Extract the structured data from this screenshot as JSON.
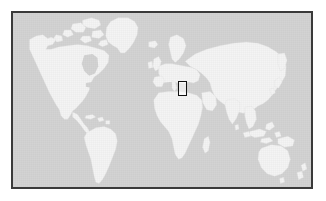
{
  "figure": {
    "kind": "locator-map",
    "title": "World locator map",
    "caption": "",
    "width_px": 326,
    "height_px": 201
  },
  "map": {
    "projection": "equirectangular",
    "lon_range": [
      -180,
      180
    ],
    "lat_range": [
      -60,
      84
    ],
    "colors": {
      "ocean": "#d2d2d2",
      "land": "#f3f3f3",
      "coastline": "#e3e3e3",
      "frame": "#3a3a3a",
      "highlight_stroke": "#111111",
      "page_background": "#ffffff"
    },
    "frame": {
      "left_px": 11,
      "top_px": 11,
      "width_px": 302,
      "height_px": 178,
      "border_px": 2
    },
    "legend": [],
    "labels": [],
    "graticule": false
  },
  "highlight": {
    "name": "highlight-rectangle",
    "description": "Small rectangle outlining a region of south-central Europe / the Balkans",
    "lon_range": [
      14,
      25
    ],
    "lat_range": [
      39,
      51
    ],
    "box_px": {
      "left": 165,
      "top": 68,
      "width": 9,
      "height": 15
    },
    "stroke": "#111111",
    "fill": "transparent"
  },
  "landmasses": [
    {
      "name": "north-america"
    },
    {
      "name": "greenland"
    },
    {
      "name": "canadian-arctic-archipelago"
    },
    {
      "name": "central-america"
    },
    {
      "name": "caribbean"
    },
    {
      "name": "south-america"
    },
    {
      "name": "europe"
    },
    {
      "name": "scandinavia"
    },
    {
      "name": "british-isles"
    },
    {
      "name": "iceland"
    },
    {
      "name": "africa"
    },
    {
      "name": "madagascar"
    },
    {
      "name": "arabian-peninsula"
    },
    {
      "name": "asia"
    },
    {
      "name": "india"
    },
    {
      "name": "japan"
    },
    {
      "name": "southeast-asia"
    },
    {
      "name": "indonesia"
    },
    {
      "name": "new-guinea"
    },
    {
      "name": "australia"
    },
    {
      "name": "new-zealand"
    }
  ]
}
